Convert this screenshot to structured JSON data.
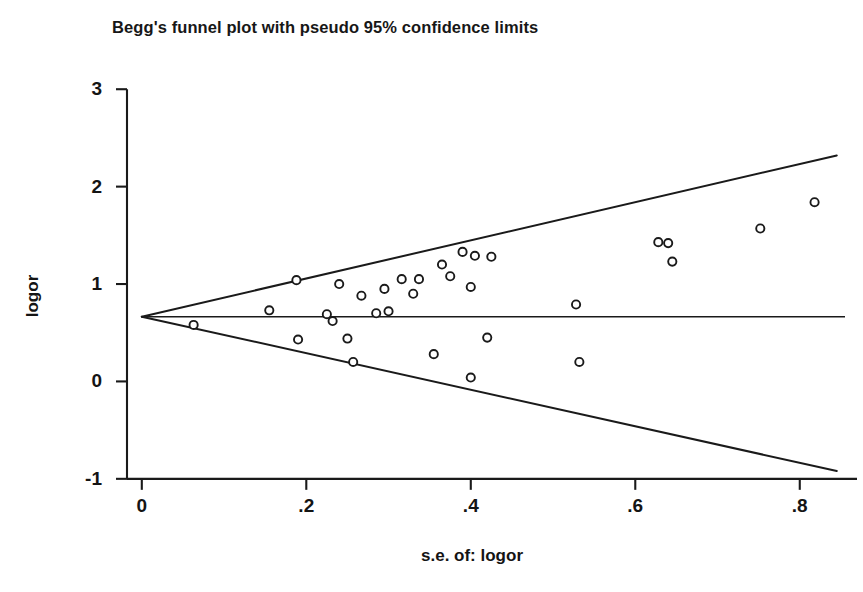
{
  "chart_data": {
    "type": "scatter",
    "title": "Begg's funnel plot with pseudo 95% confidence limits",
    "xlabel": "s.e. of: logor",
    "ylabel": "logor",
    "xlim": [
      -0.018,
      0.855
    ],
    "ylim": [
      -1.32,
      3.3
    ],
    "xticks": [
      "0",
      ".2",
      ".4",
      ".6",
      ".8"
    ],
    "xtick_values": [
      0,
      0.2,
      0.4,
      0.6,
      0.8
    ],
    "yticks": [
      "3",
      "2",
      "1",
      "0",
      "-1"
    ],
    "ytick_values": [
      3,
      2,
      1,
      0,
      -1
    ],
    "grid": false,
    "legend": false,
    "marker": "open-circle",
    "pooled_effect": 0.665,
    "pseudo_ci_multiplier": 1.96,
    "reference_line": {
      "label": "pooled logor",
      "y": 0.665,
      "x_from": 0.0,
      "x_to": 0.855
    },
    "confidence_limits": [
      {
        "name": "upper pseudo 95% limit",
        "x_from": 0.0,
        "y_from": 0.665,
        "x_to": 0.845,
        "y_to": 2.32
      },
      {
        "name": "lower pseudo 95% limit",
        "x_from": 0.0,
        "y_from": 0.665,
        "x_to": 0.845,
        "y_to": -0.92
      }
    ],
    "x": [
      0.063,
      0.155,
      0.188,
      0.19,
      0.225,
      0.232,
      0.24,
      0.25,
      0.257,
      0.267,
      0.285,
      0.295,
      0.3,
      0.316,
      0.33,
      0.337,
      0.355,
      0.365,
      0.375,
      0.39,
      0.4,
      0.4,
      0.405,
      0.42,
      0.425,
      0.528,
      0.532,
      0.628,
      0.64,
      0.645,
      0.752,
      0.818
    ],
    "y": [
      0.58,
      0.73,
      1.04,
      0.43,
      0.69,
      0.62,
      1.0,
      0.44,
      0.2,
      0.88,
      0.7,
      0.95,
      0.72,
      1.05,
      0.9,
      1.05,
      0.28,
      1.2,
      1.08,
      1.33,
      0.97,
      0.04,
      1.29,
      0.45,
      1.28,
      0.79,
      0.2,
      1.43,
      1.42,
      1.23,
      1.57,
      1.84
    ],
    "n_points": 32,
    "colors": {
      "axis": "#1a1a1a",
      "marker_stroke": "#1a1a1a",
      "marker_fill": "#ffffff",
      "limit_line": "#1a1a1a",
      "background": "#ffffff"
    }
  }
}
